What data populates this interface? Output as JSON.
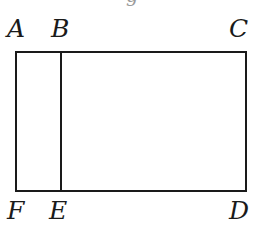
{
  "figure": {
    "type": "geometry-diagram",
    "canvas": {
      "width": 262,
      "height": 233,
      "background": "#ffffff"
    },
    "stroke_color": "#1a1a1a",
    "stroke_width": 2,
    "rectangle": {
      "left": 16,
      "top": 52,
      "right": 246,
      "bottom": 191
    },
    "divider": {
      "name": "BE",
      "x": 61,
      "y_top": 52,
      "y_bottom": 191
    },
    "labels": [
      {
        "id": "A",
        "text": "A",
        "x": 7,
        "y": 16,
        "corner": "top-left"
      },
      {
        "id": "B",
        "text": "B",
        "x": 51,
        "y": 16,
        "corner": "top-divider"
      },
      {
        "id": "C",
        "text": "C",
        "x": 229,
        "y": 16,
        "corner": "top-right"
      },
      {
        "id": "F",
        "text": "F",
        "x": 7,
        "y": 198,
        "corner": "bottom-left"
      },
      {
        "id": "E",
        "text": "E",
        "x": 49,
        "y": 198,
        "corner": "bottom-divider"
      },
      {
        "id": "D",
        "text": "D",
        "x": 229,
        "y": 198,
        "corner": "bottom-right"
      }
    ],
    "top_glyph_remnant": {
      "text": "g",
      "x": 126,
      "y": -14
    }
  }
}
